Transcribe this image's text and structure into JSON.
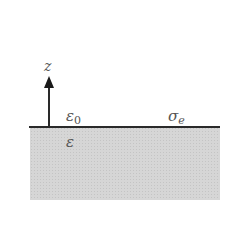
{
  "diagram": {
    "axis": {
      "label": "z",
      "direction": "up"
    },
    "upper_region": {
      "symbol": "ε",
      "subscript": "0"
    },
    "surface": {
      "symbol": "σ",
      "subscript": "e"
    },
    "lower_region": {
      "symbol": "ε"
    },
    "colors": {
      "line": "#2a2a2a",
      "medium_fill": "#d6d6d6",
      "text": "#555555"
    }
  }
}
